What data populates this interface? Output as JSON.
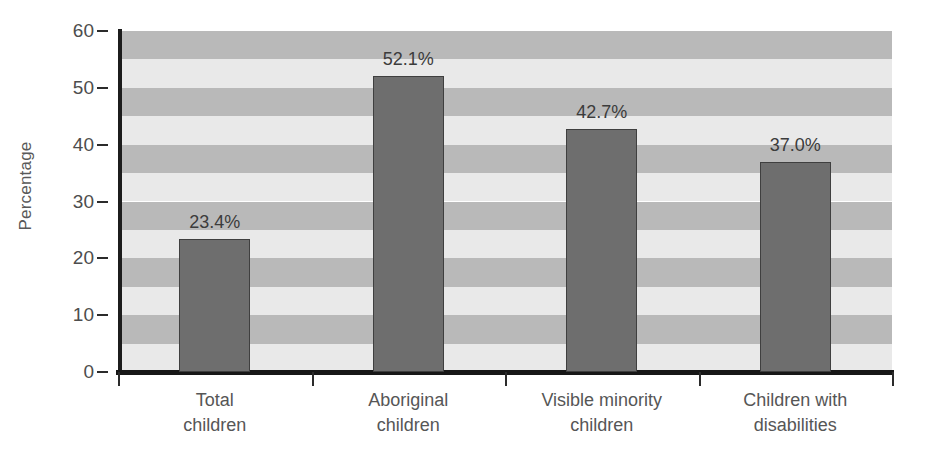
{
  "chart_data": {
    "type": "bar",
    "title": "",
    "xlabel": "",
    "ylabel": "Percentage",
    "categories": [
      "Total\nchildren",
      "Aboriginal\nchildren",
      "Visible minority\nchildren",
      "Children with\ndisabilities"
    ],
    "category_lines": [
      [
        "Total",
        "children"
      ],
      [
        "Aboriginal",
        "children"
      ],
      [
        "Visible minority",
        "children"
      ],
      [
        "Children with",
        "disabilities"
      ]
    ],
    "values": [
      23.4,
      52.1,
      42.7,
      37.0
    ],
    "data_labels": [
      "23.4%",
      "52.1%",
      "42.7%",
      "37.0%"
    ],
    "ylim": [
      0,
      60
    ],
    "yticks": [
      0,
      10,
      20,
      30,
      40,
      50,
      60
    ],
    "ytick_labels": [
      "0",
      "10",
      "20",
      "30",
      "40",
      "50",
      "60"
    ],
    "grid": false,
    "banding": {
      "interval": 5,
      "dark_color": "#b9b9b9",
      "light_color": "#e9e9e9"
    },
    "legend": null,
    "bar_color": "#6e6e6e",
    "bar_edge_color": "#3f3f3f"
  }
}
